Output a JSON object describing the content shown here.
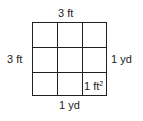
{
  "diagram": {
    "top_label": "3 ft",
    "left_label": "3 ft",
    "right_label": "1 yd",
    "bottom_label": "1 yd",
    "cell_label": "1 ft",
    "cell_label_exponent": "2",
    "grid_rows": 3,
    "grid_cols": 3
  }
}
